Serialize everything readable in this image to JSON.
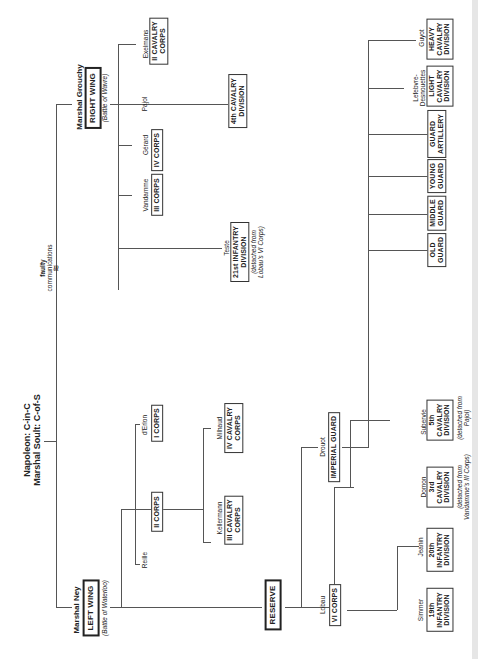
{
  "chart_title": {
    "line1": "Napoleon: C-in-C",
    "line2": "Marshal Soult: C-of-S"
  },
  "faulty_comms": {
    "line1": "faulty",
    "line2": "communications"
  },
  "right_wing": {
    "commander": "Marshal Grouchy",
    "label": "RIGHT WING",
    "note": "(Battle of Wavre)",
    "units": [
      {
        "commander": "Vandamme",
        "unit": "III CORPS"
      },
      {
        "commander": "Gérard",
        "unit": "IV CORPS"
      },
      {
        "commander": "Exelmans",
        "unit_l1": "II CAVALRY",
        "unit_l2": "CORPS"
      },
      {
        "commander": "Pajol",
        "unit_l1": "4th CAVALRY",
        "unit_l2": "DIVISION"
      },
      {
        "commander": "Teste",
        "unit_l1": "21st INFANTRY",
        "unit_l2": "DIVISION",
        "note_l1": "(detached from",
        "note_l2": "Lobau's VI Corps)"
      }
    ]
  },
  "left_wing": {
    "commander": "Marshal Ney",
    "label": "LEFT WING",
    "note": "(Battle of Waterloo)",
    "units": [
      {
        "commander": "Reille",
        "unit": "II CORPS"
      },
      {
        "commander": "d'Erlon",
        "unit": "I CORPS"
      },
      {
        "commander": "Kellermann",
        "unit_l1": "III CAVALRY",
        "unit_l2": "CORPS"
      },
      {
        "commander": "Milhaud",
        "unit_l1": "IV CAVALRY",
        "unit_l2": "CORPS"
      }
    ]
  },
  "reserve": {
    "label": "RESERVE",
    "vi_corps": {
      "commander": "Lobau",
      "label": "VI CORPS",
      "units": [
        {
          "commander": "Simmer",
          "l1": "19th",
          "l2": "INFANTRY",
          "l3": "DIVISION"
        },
        {
          "commander": "Jeanin",
          "l1": "20th",
          "l2": "INFANTRY",
          "l3": "DIVISION"
        },
        {
          "commander": "Domon",
          "l1": "3rd",
          "l2": "CAVALRY",
          "l3": "DIVISION",
          "note_l1": "(detached from",
          "note_l2": "Vandamme's III Corps)"
        },
        {
          "commander": "Subervie",
          "l1": "5th",
          "l2": "CAVALRY",
          "l3": "DIVISION",
          "note_l1": "(detached from",
          "note_l2": "Pajol)"
        }
      ]
    },
    "imperial_guard": {
      "commander": "Drouot",
      "label": "IMPERIAL GUARD",
      "units": [
        {
          "commander": "",
          "l1": "OLD",
          "l2": "GUARD"
        },
        {
          "commander": "",
          "l1": "MIDDLE",
          "l2": "GUARD"
        },
        {
          "commander": "",
          "l1": "YOUNG",
          "l2": "GUARD"
        },
        {
          "commander": "",
          "l1": "GUARD",
          "l2": "ARTILLERY"
        },
        {
          "commander_l1": "Lefebvre-",
          "commander_l2": "Desnouettes",
          "l1": "LIGHT",
          "l2": "CAVALRY",
          "l3": "DIVISION"
        },
        {
          "commander": "Guyot",
          "l1": "HEAVY",
          "l2": "CAVALRY",
          "l3": "DIVISION"
        }
      ]
    }
  }
}
